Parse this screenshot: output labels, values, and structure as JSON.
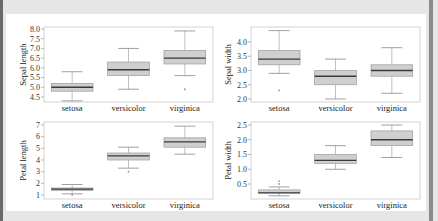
{
  "colors": {
    "box_fill": "#cfcfcf",
    "box_edge": "#9a9a9a",
    "median": "#3a3a3a",
    "whisker": "#b0b0b0",
    "frame": "#c8c8c8",
    "background": "#e6e6e6",
    "panel": "#ffffff"
  },
  "chart_data": [
    {
      "type": "box",
      "title": "",
      "xlabel": "",
      "ylabel": "Sepal length",
      "categories": [
        "setosa",
        "versicolor",
        "virginica"
      ],
      "yticks": [
        "4.5",
        "5.0",
        "5.5",
        "6.0",
        "6.5",
        "7.0",
        "7.5",
        "8.0"
      ],
      "ylim": [
        4.3,
        8.05
      ],
      "grid": false,
      "boxes": [
        {
          "category": "setosa",
          "whislo": 4.3,
          "q1": 4.8,
          "median": 5.0,
          "q3": 5.2,
          "whishi": 5.8,
          "outliers": []
        },
        {
          "category": "versicolor",
          "whislo": 4.9,
          "q1": 5.6,
          "median": 5.9,
          "q3": 6.3,
          "whishi": 7.0,
          "outliers": []
        },
        {
          "category": "virginica",
          "whislo": 5.6,
          "q1": 6.2,
          "median": 6.5,
          "q3": 6.9,
          "whishi": 7.9,
          "outliers": [
            4.9
          ]
        }
      ]
    },
    {
      "type": "box",
      "title": "",
      "xlabel": "",
      "ylabel": "Sepal width",
      "categories": [
        "setosa",
        "versicolor",
        "virginica"
      ],
      "yticks": [
        "2.0",
        "2.5",
        "3.0",
        "3.5",
        "4.0"
      ],
      "ylim": [
        1.95,
        4.5
      ],
      "grid": false,
      "boxes": [
        {
          "category": "setosa",
          "whislo": 2.9,
          "q1": 3.2,
          "median": 3.4,
          "q3": 3.7,
          "whishi": 4.4,
          "outliers": [
            2.3
          ]
        },
        {
          "category": "versicolor",
          "whislo": 2.0,
          "q1": 2.5,
          "median": 2.8,
          "q3": 3.0,
          "whishi": 3.4,
          "outliers": []
        },
        {
          "category": "virginica",
          "whislo": 2.2,
          "q1": 2.8,
          "median": 3.0,
          "q3": 3.2,
          "whishi": 3.8,
          "outliers": []
        }
      ]
    },
    {
      "type": "box",
      "title": "",
      "xlabel": "",
      "ylabel": "Petal length",
      "categories": [
        "setosa",
        "versicolor",
        "virginica"
      ],
      "yticks": [
        "1",
        "2",
        "3",
        "4",
        "5",
        "6",
        "7"
      ],
      "ylim": [
        0.8,
        7.1
      ],
      "grid": false,
      "boxes": [
        {
          "category": "setosa",
          "whislo": 1.1,
          "q1": 1.4,
          "median": 1.5,
          "q3": 1.6,
          "whishi": 1.9,
          "outliers": [
            1.0
          ]
        },
        {
          "category": "versicolor",
          "whislo": 3.3,
          "q1": 4.0,
          "median": 4.35,
          "q3": 4.6,
          "whishi": 5.1,
          "outliers": [
            3.0
          ]
        },
        {
          "category": "virginica",
          "whislo": 4.5,
          "q1": 5.1,
          "median": 5.55,
          "q3": 5.9,
          "whishi": 6.9,
          "outliers": []
        }
      ]
    },
    {
      "type": "box",
      "title": "",
      "xlabel": "",
      "ylabel": "Petal width",
      "categories": [
        "setosa",
        "versicolor",
        "virginica"
      ],
      "yticks": [
        "0.5",
        "1.0",
        "1.5",
        "2.0",
        "2.5"
      ],
      "ylim": [
        0.0,
        2.55
      ],
      "grid": false,
      "boxes": [
        {
          "category": "setosa",
          "whislo": 0.1,
          "q1": 0.2,
          "median": 0.2,
          "q3": 0.3,
          "whishi": 0.4,
          "outliers": [
            0.5,
            0.6
          ]
        },
        {
          "category": "versicolor",
          "whislo": 1.0,
          "q1": 1.2,
          "median": 1.3,
          "q3": 1.5,
          "whishi": 1.8,
          "outliers": []
        },
        {
          "category": "virginica",
          "whislo": 1.4,
          "q1": 1.8,
          "median": 2.0,
          "q3": 2.3,
          "whishi": 2.5,
          "outliers": []
        }
      ]
    }
  ],
  "layout": {
    "panels": [
      {
        "x0": 44,
        "x1": 213,
        "y0": 27,
        "y1": 102,
        "ytop_val": 8.0,
        "ytop_px": 29,
        "ybot_val": 4.5,
        "ybot_px": 97,
        "label_x": 26,
        "tick_x": 40
      },
      {
        "x0": 251,
        "x1": 420,
        "y0": 27,
        "y1": 102,
        "ytop_val": 4.0,
        "ytop_px": 42,
        "ybot_val": 2.0,
        "ybot_px": 99,
        "label_x": 231,
        "tick_x": 247
      },
      {
        "x0": 44,
        "x1": 213,
        "y0": 122,
        "y1": 199,
        "ytop_val": 7,
        "ytop_px": 125,
        "ybot_val": 1,
        "ybot_px": 195,
        "label_x": 26,
        "tick_x": 40
      },
      {
        "x0": 251,
        "x1": 420,
        "y0": 122,
        "y1": 199,
        "ytop_val": 2.5,
        "ytop_px": 125,
        "ybot_val": 0.5,
        "ybot_px": 184,
        "label_x": 231,
        "tick_x": 247
      }
    ]
  }
}
